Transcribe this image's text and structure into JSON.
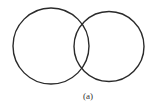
{
  "diagram": {
    "type": "venn",
    "caption": "(a)",
    "stroke_color": "#2a2a2a",
    "circles": [
      {
        "name": "left",
        "cx": 51,
        "cy": 46,
        "r": 38
      },
      {
        "name": "right",
        "cx": 109,
        "cy": 46.5,
        "r": 35
      }
    ]
  }
}
